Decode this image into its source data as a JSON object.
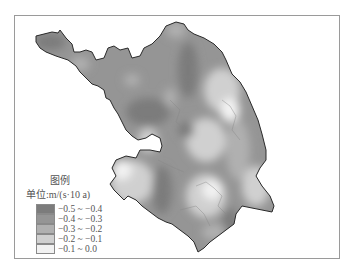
{
  "legend": {
    "title": "图例",
    "unit": "单位:m/(s·10 a)",
    "items": [
      {
        "label": "−0.5 ~ −0.4",
        "color": "#7c7c7c"
      },
      {
        "label": "−0.4 ~ −0.3",
        "color": "#959595"
      },
      {
        "label": "−0.3 ~ −0.2",
        "color": "#b0b0b0"
      },
      {
        "label": "−0.2 ~ −0.1",
        "color": "#d0d0d0"
      },
      {
        "label": "−0.1 ~ 0.0",
        "color": "#f2f2f2"
      }
    ]
  },
  "map": {
    "outline_color": "#2a2a2a",
    "frame_color": "#9a9a9a"
  }
}
